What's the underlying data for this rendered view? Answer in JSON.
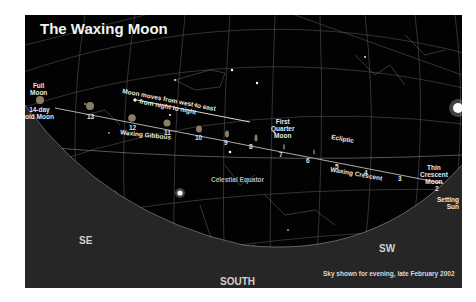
{
  "title": "The Waxing Moon",
  "annotations": {
    "motion_line1": "Moon moves from west to east",
    "motion_line2": "from night to night",
    "full_moon": [
      "Full",
      "Moon"
    ],
    "old_moon": [
      "14-day",
      "old Moon"
    ],
    "waxing_gibbous": "Waxing Gibbous",
    "first_quarter": [
      "First",
      "Quarter",
      "Moon"
    ],
    "ecliptic": "Ecliptic",
    "celestial_equator": "Celestial Equator",
    "waxing_crescent": "Waxing Crescent",
    "thin_crescent": [
      "Thin",
      "Crescent",
      "Moon"
    ],
    "setting_sun": [
      "Setting",
      "Sun"
    ]
  },
  "moon_days": [
    "2",
    "3",
    "4",
    "5",
    "6",
    "7",
    "8",
    "9",
    "10",
    "11",
    "12",
    "13"
  ],
  "directions": {
    "se": "SE",
    "south": "SOUTH",
    "sw": "SW"
  },
  "caption": "Sky shown for evening, late February 2002",
  "colors": {
    "sky": "#020202",
    "ground": "#2a2a2a",
    "grid": "#8a8a8a",
    "text": "#e8e8e8",
    "moon": "#9a8a6a"
  }
}
